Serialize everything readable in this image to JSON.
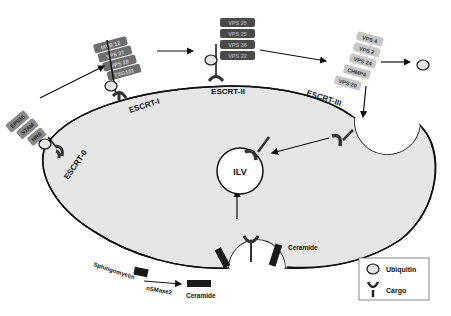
{
  "diagram": {
    "type": "ESCRT pathway / ILV formation",
    "complexes": [
      {
        "name": "ESCRT-0",
        "proteins": [
          "EPS15",
          "STAM",
          "HRS"
        ]
      },
      {
        "name": "ESCRT-I",
        "proteins": [
          "MVB 12",
          "VPS 37",
          "VPS 28",
          "TSG101"
        ]
      },
      {
        "name": "ESCRT-II",
        "proteins": [
          "VPS 25",
          "VPS 25",
          "VPS 36",
          "VPS 22"
        ]
      },
      {
        "name": "ESCRT-III",
        "proteins": [
          "VPS 4",
          "VPS 2",
          "VPS 24",
          "CHMP4",
          "VPS 20"
        ]
      }
    ],
    "ilv_label": "ILV",
    "ceramide_pathway": {
      "substrate": "Sphingomyelin",
      "enzyme": "nSMase2",
      "product": "Ceramide",
      "budding_label": "Ceramide"
    },
    "legend": {
      "items": [
        {
          "icon": "ubiquitin-icon",
          "label": "Ubiquitin"
        },
        {
          "icon": "cargo-icon",
          "label": "Cargo"
        }
      ]
    },
    "colors": {
      "cell_fill": "#e6e6e6",
      "escrt0_box": "#8a8a8a",
      "escrt1_box": "#6e6e6e",
      "escrt2_box": "#4a4a4a",
      "escrt3_box": "#c8c8c8",
      "line": "#111111"
    }
  }
}
